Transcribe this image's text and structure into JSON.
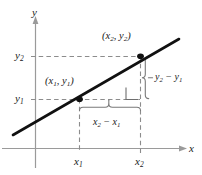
{
  "figure": {
    "background_color": "#ffffff",
    "ink_color": "#1a1a1a",
    "axis_color": "#9a9a9a",
    "dash_color": "#8c8c8c",
    "line_color": "#111111"
  },
  "axes": {
    "y_axis_label": "y",
    "x_axis_label": "x",
    "origin_px": {
      "x": 35,
      "y": 148
    }
  },
  "ticks": {
    "y": [
      {
        "label_html": "y<sub>2</sub>",
        "text": "y2",
        "value_px": 56
      },
      {
        "label_html": "y<sub>1</sub>",
        "text": "y1",
        "value_px": 99
      }
    ],
    "x": [
      {
        "label_html": "x<sub>1</sub>",
        "text": "x1",
        "value_px": 79
      },
      {
        "label_html": "x<sub>2</sub>",
        "text": "x2",
        "value_px": 140
      }
    ]
  },
  "points": [
    {
      "name": "point-1",
      "label_html": "(x<sub>1</sub>, y<sub>1</sub>)",
      "text": "(x1, y1)",
      "px": {
        "x": 79,
        "y": 99
      }
    },
    {
      "name": "point-2",
      "label_html": "(x<sub>2</sub>, y<sub>2</sub>)",
      "text": "(x2, y2)",
      "px": {
        "x": 140,
        "y": 56
      }
    }
  ],
  "annotations": {
    "rise": {
      "label_html": "y<sub>2</sub> &minus; y<sub>1</sub>",
      "text": "y2 - y1",
      "brace": "vertical-right"
    },
    "run": {
      "label_html": "x<sub>2</sub> &minus; x<sub>1</sub>",
      "text": "x2 - x1",
      "brace": "horizontal-bottom"
    },
    "right_angle": {
      "name": "right-angle-marker",
      "px": {
        "x": 126,
        "y": 88,
        "size": 12
      }
    }
  },
  "line": {
    "name": "secant-line",
    "from_px": {
      "x": 13,
      "y": 135
    },
    "to_px": {
      "x": 179,
      "y": 39
    },
    "stroke_width": 2.6
  }
}
